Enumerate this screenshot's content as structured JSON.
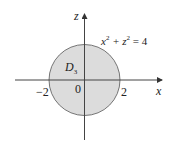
{
  "figure": {
    "region_label": "D",
    "region_subscript": "3",
    "equation": "x² + z² = 4",
    "x_axis_label": "x",
    "z_axis_label": "z",
    "origin_label": "0",
    "tick_left": "−2",
    "tick_right": "2",
    "fill_color": "#dcdcdc",
    "stroke_color": "#444444"
  }
}
